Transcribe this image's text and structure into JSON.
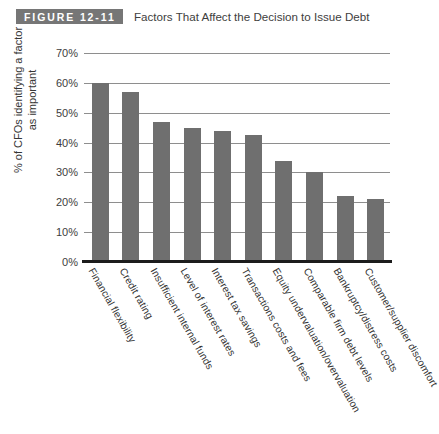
{
  "figure": {
    "banner_label": "FIGURE 12-11",
    "title": "Factors That Affect the Decision to Issue Debt",
    "banner_color": "#767676"
  },
  "chart_data": {
    "type": "bar",
    "title": "Factors That Affect the Decision to Issue Debt",
    "xlabel": "",
    "ylabel": "% of CFOs identifying a factor as important",
    "ylabel_line1": "% of CFOs identifying a factor",
    "ylabel_line2": "as important",
    "ylim": [
      0,
      70
    ],
    "ytick_labels": [
      "70%",
      "60%",
      "50%",
      "40%",
      "30%",
      "20%",
      "10%",
      "0%"
    ],
    "ytick_values": [
      70,
      60,
      50,
      40,
      30,
      20,
      10,
      0
    ],
    "grid": true,
    "legend": "none",
    "bar_color": "#6f6f6f",
    "categories": [
      "Financial flexibility",
      "Credit rating",
      "Insufficient internal funds",
      "Level of interest rates",
      "Interest tax savings",
      "Transactions costs and fees",
      "Equity undervaluation/overvaluation",
      "Comparable firm debt levels",
      "Bankruptcy/distress costs",
      "Customer/supplier discomfort"
    ],
    "values": [
      60,
      57,
      47,
      45,
      44,
      42.5,
      34,
      30,
      22,
      21
    ]
  }
}
